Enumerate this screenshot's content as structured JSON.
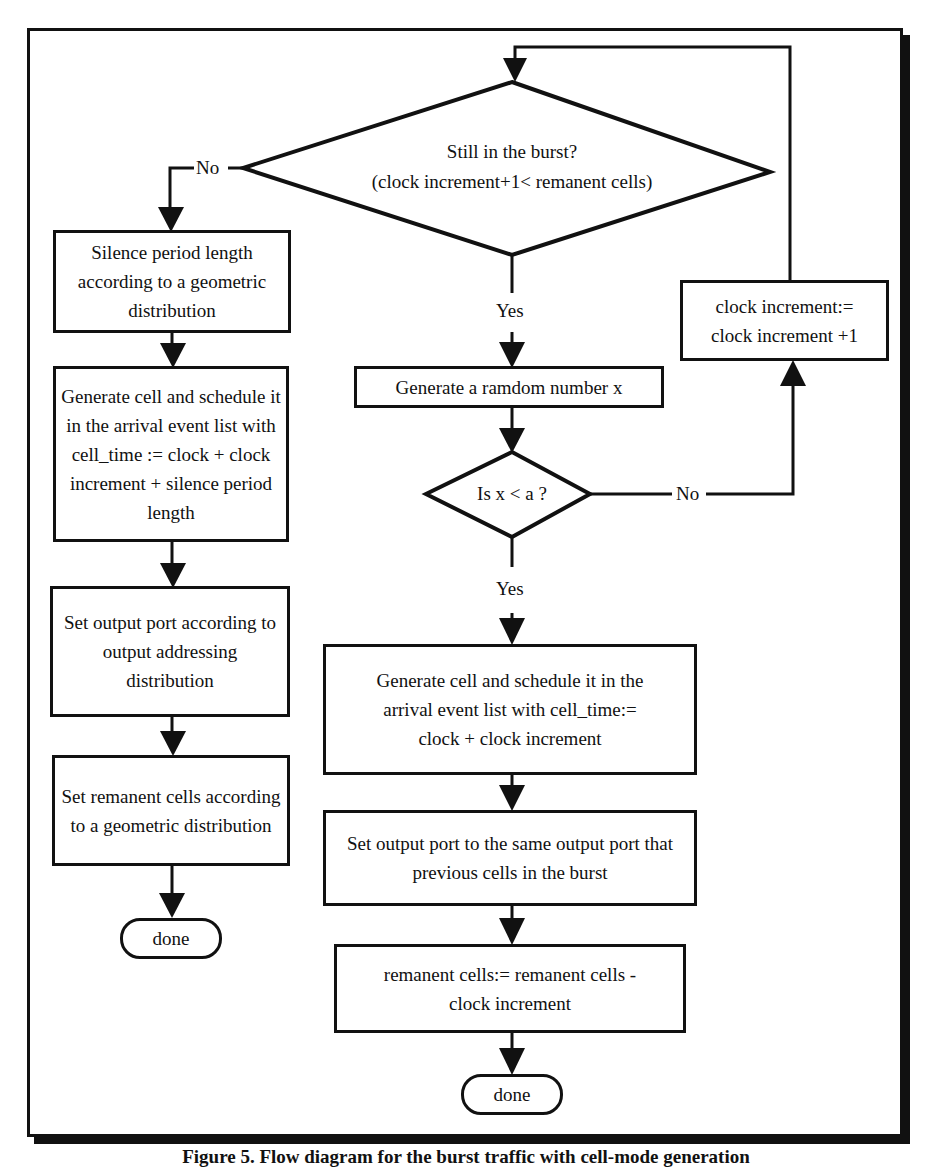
{
  "diagram": {
    "type": "flowchart",
    "caption": "Figure 5. Flow diagram for the burst traffic with cell-mode generation",
    "decisions": {
      "burst_check": {
        "line1": "Still in the burst?",
        "line2": "(clock increment+1< remanent cells)",
        "no_label": "No",
        "yes_label": "Yes"
      },
      "random_check": {
        "text": "Is x < a ?",
        "no_label": "No",
        "yes_label": "Yes"
      }
    },
    "left_column": {
      "silence_box": "Silence period length according to a geometric distribution",
      "generate_box": "Generate cell and schedule it in the arrival event list with cell_time := clock + clock increment + silence period length",
      "output_port_box": "Set output port according to output addressing distribution",
      "remanent_box": "Set remanent cells according to a geometric distribution",
      "done": "done"
    },
    "middle_column": {
      "random_box": "Generate a ramdom number x",
      "generate_box": "Generate cell and schedule it in the arrival event list with cell_time:= clock + clock increment",
      "output_port_box": "Set output port to the same output port that previous cells in the burst",
      "remanent_box": "remanent cells:= remanent cells - clock increment",
      "done": "done"
    },
    "right_column": {
      "clock_box": "clock increment:= clock increment +1"
    }
  }
}
